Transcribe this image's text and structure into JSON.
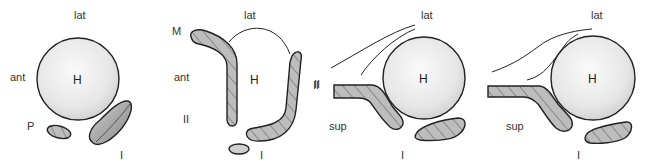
{
  "colors": {
    "head_fill_light": "#f4f4f4",
    "head_fill_dark": "#cfcfcf",
    "structure_fill": "#b9b9b9",
    "hatch": "#555555",
    "outline": "#222222",
    "label": "#333333"
  },
  "panels": [
    {
      "id": "panel-1",
      "labels": {
        "top": "lat",
        "left": "ant",
        "head": "H",
        "small": "P",
        "bottom": "I"
      }
    },
    {
      "id": "panel-2",
      "labels": {
        "corner": "M",
        "top": "lat",
        "left": "ant",
        "head": "H",
        "lower_left": "II",
        "right": "II",
        "bottom": "I"
      }
    },
    {
      "id": "panel-3",
      "labels": {
        "top": "lat",
        "head": "H",
        "left": "II",
        "lower_left": "sup",
        "bottom": "I"
      }
    },
    {
      "id": "panel-4",
      "labels": {
        "top": "lat",
        "head": "H",
        "lower_left": "sup",
        "bottom": "I"
      }
    }
  ]
}
